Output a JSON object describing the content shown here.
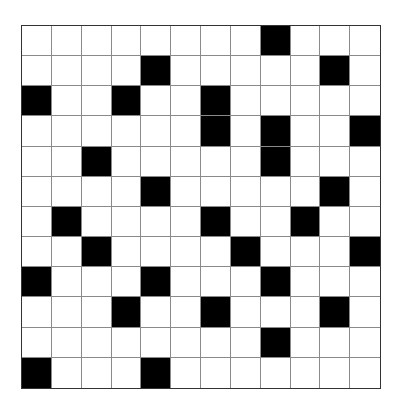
{
  "puzzle": {
    "type": "crossword-grid",
    "rows": 12,
    "cols": 12,
    "colors": {
      "black_cell": "#000000",
      "white_cell": "#ffffff",
      "grid_line": "#8a8a8a",
      "border": "#333333"
    },
    "black_cells": [
      [
        0,
        8
      ],
      [
        1,
        4
      ],
      [
        1,
        10
      ],
      [
        2,
        0
      ],
      [
        2,
        3
      ],
      [
        2,
        6
      ],
      [
        3,
        6
      ],
      [
        3,
        8
      ],
      [
        3,
        11
      ],
      [
        4,
        2
      ],
      [
        4,
        8
      ],
      [
        5,
        4
      ],
      [
        5,
        10
      ],
      [
        6,
        1
      ],
      [
        6,
        6
      ],
      [
        6,
        9
      ],
      [
        7,
        2
      ],
      [
        7,
        7
      ],
      [
        7,
        11
      ],
      [
        8,
        0
      ],
      [
        8,
        4
      ],
      [
        8,
        8
      ],
      [
        9,
        3
      ],
      [
        9,
        6
      ],
      [
        9,
        10
      ],
      [
        10,
        8
      ],
      [
        11,
        0
      ],
      [
        11,
        4
      ]
    ]
  }
}
